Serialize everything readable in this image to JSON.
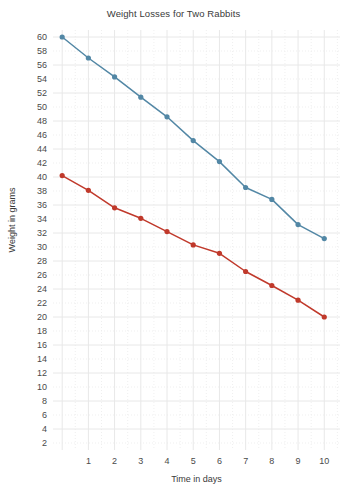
{
  "chart_data": {
    "type": "line",
    "title": "Weight Losses for Two Rabbits",
    "xlabel": "Time in days",
    "ylabel": "Weight in grams",
    "xlim": [
      -0.35,
      10.6
    ],
    "ylim": [
      1.0,
      61.0
    ],
    "grid": true,
    "legend": "none",
    "x_ticks": [
      1,
      2,
      3,
      4,
      5,
      6,
      7,
      8,
      9,
      10
    ],
    "y_ticks": [
      2,
      4,
      6,
      8,
      10,
      12,
      14,
      16,
      18,
      20,
      22,
      24,
      26,
      28,
      30,
      32,
      34,
      36,
      38,
      40,
      42,
      44,
      46,
      48,
      50,
      52,
      54,
      56,
      58,
      60
    ],
    "x": [
      0,
      1,
      2,
      3,
      4,
      5,
      6,
      7,
      8,
      9,
      10
    ],
    "series": [
      {
        "name": "rabbit-1",
        "color": "#5287a5",
        "marker": "circle",
        "values": [
          60.0,
          57.0,
          54.3,
          51.4,
          48.6,
          45.2,
          42.2,
          38.5,
          36.8,
          33.2,
          31.2
        ]
      },
      {
        "name": "rabbit-2",
        "color": "#c0392b",
        "marker": "circle",
        "values": [
          40.2,
          38.1,
          35.6,
          34.1,
          32.2,
          30.3,
          29.1,
          26.5,
          24.5,
          22.4,
          20.0
        ]
      }
    ],
    "colors": {
      "series_1": "#5287a5",
      "series_2": "#c0392b",
      "grid_major": "#e8e8e8",
      "grid_minor": "#ededed",
      "background": "#ffffff",
      "text": "#3a3a3a"
    },
    "plot_area": {
      "left": 53,
      "top": 30,
      "right": 340,
      "bottom": 450
    }
  }
}
